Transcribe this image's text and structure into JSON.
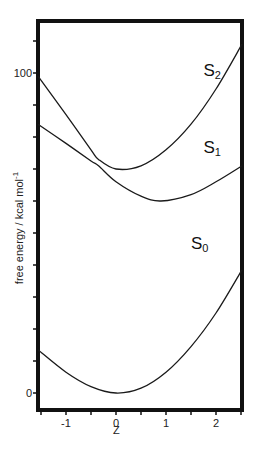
{
  "chart_data": {
    "type": "line",
    "title": "",
    "xlabel": "Z",
    "ylabel": "free energy / kcal mol-1",
    "ylabel_parts": {
      "main": "free energy / kcal mol",
      "sup": "-1"
    },
    "xlim": [
      -1.56,
      2.52
    ],
    "ylim": [
      -5,
      115
    ],
    "x_ticks": [
      -1.5,
      -1,
      -0.5,
      0,
      0.5,
      1,
      1.5,
      2,
      2.5
    ],
    "x_tick_labels": [
      {
        "value": -1,
        "label": "-1"
      },
      {
        "value": 0,
        "label": "0"
      },
      {
        "value": 1,
        "label": "1"
      },
      {
        "value": 2,
        "label": "2"
      }
    ],
    "y_ticks": [
      0,
      10,
      20,
      30,
      40,
      50,
      60,
      70,
      80,
      90,
      100,
      110
    ],
    "y_tick_labels": [
      {
        "value": 0,
        "label": "0"
      },
      {
        "value": 100,
        "label": "100"
      }
    ],
    "grid": false,
    "legend": "inline labels",
    "series": [
      {
        "name": "S0",
        "label_main": "S",
        "label_sub": "0",
        "label_pos": {
          "x": 1.5,
          "y": 45
        },
        "x": [
          -1.56,
          -1.0,
          -0.5,
          0.0,
          0.5,
          1.0,
          1.5,
          2.0,
          2.52
        ],
        "values": [
          13.5,
          6.5,
          2.0,
          0.0,
          1.5,
          6.5,
          14.5,
          25.0,
          38.5
        ]
      },
      {
        "name": "S1",
        "label_main": "S",
        "label_sub": "1",
        "label_pos": {
          "x": 1.75,
          "y": 75
        },
        "x": [
          -1.56,
          -1.0,
          -0.5,
          -0.35,
          0.0,
          0.5,
          0.9,
          1.5,
          2.0,
          2.52
        ],
        "values": [
          84,
          78,
          72.5,
          71,
          66,
          61.5,
          60,
          62,
          66,
          71
        ]
      },
      {
        "name": "S2",
        "label_main": "S",
        "label_sub": "2",
        "label_pos": {
          "x": 1.75,
          "y": 99
        },
        "x": [
          -1.56,
          -1.0,
          -0.5,
          -0.35,
          0.0,
          0.5,
          1.0,
          1.5,
          2.0,
          2.52
        ],
        "values": [
          99,
          87,
          76,
          73,
          70,
          71,
          76,
          84,
          95,
          109
        ]
      }
    ]
  }
}
